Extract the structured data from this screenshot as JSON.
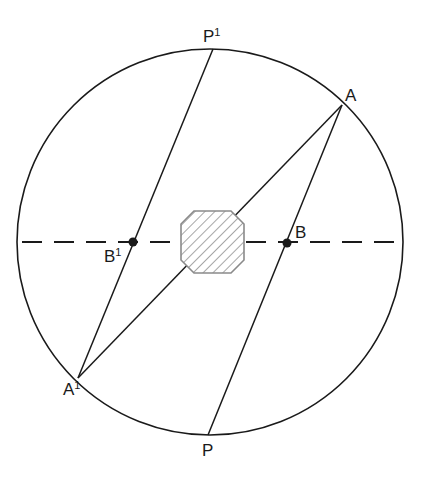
{
  "diagram": {
    "type": "geometry",
    "circle": {
      "cx": 210,
      "cy": 242,
      "r": 193
    },
    "points": {
      "P1": {
        "label": "P",
        "sup": "1",
        "x": 213,
        "y": 49
      },
      "A": {
        "label": "A",
        "sup": "",
        "x": 342,
        "y": 105
      },
      "A1": {
        "label": "A",
        "sup": "1",
        "x": 78,
        "y": 378
      },
      "P": {
        "label": "P",
        "sup": "",
        "x": 208,
        "y": 435
      },
      "B": {
        "label": "B",
        "sup": "",
        "x": 287,
        "y": 243
      },
      "B1": {
        "label": "B",
        "sup": "1",
        "x": 133,
        "y": 242
      }
    },
    "lines": [
      {
        "from": "P1",
        "to": "A1"
      },
      {
        "from": "A",
        "to": "A1"
      },
      {
        "from": "A",
        "to": "P"
      }
    ],
    "dashed_diameter": {
      "y": 242,
      "x1": 22,
      "x2": 399
    },
    "obstacle": {
      "shape": "octagon",
      "fill": "hatched",
      "cx": 212,
      "cy": 242,
      "size": 62
    },
    "colors": {
      "line": "#1a1a1a",
      "octagon_stroke": "#8a8a8a",
      "hatch": "#8a8a8a"
    }
  }
}
